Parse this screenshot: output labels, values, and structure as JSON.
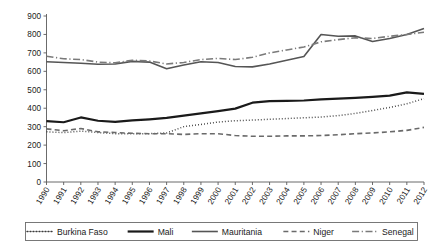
{
  "chart_data": {
    "type": "line",
    "title": "",
    "xlabel": "",
    "ylabel": "",
    "ylim": [
      0,
      900
    ],
    "ytick_step": 100,
    "grid": false,
    "legend_position": "bottom",
    "categories": [
      "1990",
      "1991",
      "1992",
      "1993",
      "1994",
      "1995",
      "1996",
      "1997",
      "1998",
      "1999",
      "2000",
      "2001",
      "2002",
      "2003",
      "2004",
      "2005",
      "2006",
      "2007",
      "2008",
      "2009",
      "2010",
      "2011",
      "2012"
    ],
    "yticks": [
      "0",
      "100",
      "200",
      "300",
      "400",
      "500",
      "600",
      "700",
      "800",
      "900"
    ],
    "series": [
      {
        "name": "Burkina Faso",
        "style": "dotted",
        "color": "#3c3c3c",
        "width": 1.5,
        "values": [
          272,
          268,
          276,
          268,
          262,
          262,
          262,
          266,
          300,
          312,
          325,
          332,
          336,
          340,
          344,
          348,
          352,
          360,
          372,
          388,
          404,
          424,
          452
        ]
      },
      {
        "name": "Mali",
        "style": "solid-thick",
        "color": "#1a1a1a",
        "width": 2.2,
        "values": [
          330,
          324,
          350,
          332,
          326,
          334,
          340,
          348,
          360,
          372,
          384,
          398,
          430,
          438,
          440,
          442,
          448,
          452,
          456,
          462,
          468,
          486,
          478
        ]
      },
      {
        "name": "Mauritania",
        "style": "solid",
        "color": "#555555",
        "width": 1.6,
        "values": [
          652,
          648,
          644,
          638,
          640,
          654,
          650,
          614,
          634,
          652,
          648,
          626,
          624,
          640,
          660,
          680,
          800,
          790,
          792,
          762,
          778,
          800,
          832
        ]
      },
      {
        "name": "Niger",
        "style": "dashed",
        "color": "#6a6a6a",
        "width": 1.6,
        "values": [
          288,
          278,
          290,
          272,
          268,
          264,
          262,
          262,
          258,
          262,
          262,
          252,
          248,
          248,
          250,
          250,
          252,
          256,
          262,
          266,
          272,
          280,
          296
        ]
      },
      {
        "name": "Senegal",
        "style": "dash-dot",
        "color": "#7a7a7a",
        "width": 1.6,
        "values": [
          682,
          668,
          664,
          650,
          646,
          660,
          656,
          640,
          648,
          664,
          670,
          664,
          676,
          700,
          716,
          732,
          760,
          772,
          782,
          778,
          790,
          800,
          812
        ]
      }
    ]
  },
  "legend": {
    "items": [
      {
        "label": "Burkina Faso"
      },
      {
        "label": "Mali"
      },
      {
        "label": "Mauritania"
      },
      {
        "label": "Niger"
      },
      {
        "label": "Senegal"
      }
    ]
  }
}
